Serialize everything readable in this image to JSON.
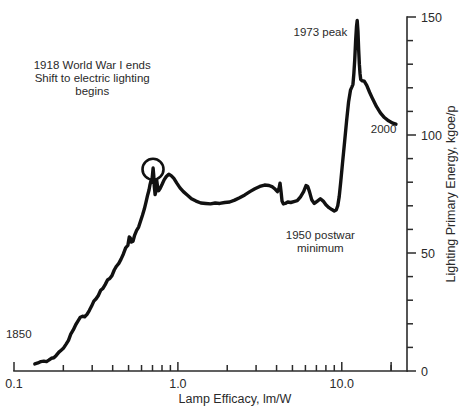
{
  "chart_data": {
    "type": "line",
    "title": "",
    "xlabel": "Lamp Efficacy, lm/W",
    "ylabel": "Lighting Primary Energy, kgoe/p",
    "xscale": "log",
    "xlim": [
      0.1,
      25
    ],
    "ylim": [
      0,
      150
    ],
    "x_tick_labels": [
      "0.1",
      "1.0",
      "10.0"
    ],
    "x_tick_values": [
      0.1,
      1.0,
      10.0
    ],
    "y_tick_labels": [
      "0",
      "50",
      "100",
      "150"
    ],
    "y_tick_values": [
      0,
      50,
      100,
      150
    ],
    "y_minor_step": 10,
    "grid": false,
    "legend": "none",
    "series_name": "UK lighting primary energy per capita vs lamp efficacy",
    "line_color": "#111111",
    "axis_color": "#2b2b2b",
    "points": [
      [
        0.134,
        3.0
      ],
      [
        0.14,
        3.4
      ],
      [
        0.146,
        4.0
      ],
      [
        0.152,
        4.2
      ],
      [
        0.158,
        4.0
      ],
      [
        0.163,
        4.6
      ],
      [
        0.169,
        5.4
      ],
      [
        0.175,
        5.6
      ],
      [
        0.181,
        6.6
      ],
      [
        0.188,
        8.0
      ],
      [
        0.194,
        8.8
      ],
      [
        0.2,
        9.6
      ],
      [
        0.208,
        11.4
      ],
      [
        0.215,
        13.0
      ],
      [
        0.222,
        15.6
      ],
      [
        0.23,
        17.4
      ],
      [
        0.238,
        19.6
      ],
      [
        0.246,
        21.2
      ],
      [
        0.254,
        22.8
      ],
      [
        0.262,
        23.2
      ],
      [
        0.27,
        23.0
      ],
      [
        0.279,
        24.0
      ],
      [
        0.288,
        25.6
      ],
      [
        0.297,
        27.4
      ],
      [
        0.307,
        29.6
      ],
      [
        0.317,
        30.6
      ],
      [
        0.327,
        32.0
      ],
      [
        0.338,
        34.2
      ],
      [
        0.349,
        35.0
      ],
      [
        0.36,
        36.6
      ],
      [
        0.372,
        38.6
      ],
      [
        0.384,
        39.2
      ],
      [
        0.396,
        40.4
      ],
      [
        0.409,
        42.8
      ],
      [
        0.422,
        44.4
      ],
      [
        0.436,
        45.6
      ],
      [
        0.45,
        47.4
      ],
      [
        0.465,
        49.6
      ],
      [
        0.48,
        52.2
      ],
      [
        0.495,
        53.2
      ],
      [
        0.505,
        56.8
      ],
      [
        0.512,
        56.4
      ],
      [
        0.52,
        54.6
      ],
      [
        0.532,
        55.0
      ],
      [
        0.545,
        57.6
      ],
      [
        0.56,
        59.6
      ],
      [
        0.576,
        61.0
      ],
      [
        0.592,
        63.6
      ],
      [
        0.608,
        66.0
      ],
      [
        0.624,
        68.6
      ],
      [
        0.64,
        71.8
      ],
      [
        0.654,
        74.6
      ],
      [
        0.666,
        76.6
      ],
      [
        0.676,
        79.0
      ],
      [
        0.684,
        80.4
      ],
      [
        0.692,
        80.0
      ],
      [
        0.7,
        83.2
      ],
      [
        0.706,
        86.0
      ],
      [
        0.712,
        83.0
      ],
      [
        0.718,
        78.2
      ],
      [
        0.726,
        74.8
      ],
      [
        0.734,
        76.0
      ],
      [
        0.742,
        81.0
      ],
      [
        0.752,
        78.0
      ],
      [
        0.764,
        76.4
      ],
      [
        0.78,
        77.4
      ],
      [
        0.8,
        79.0
      ],
      [
        0.824,
        81.0
      ],
      [
        0.85,
        82.4
      ],
      [
        0.88,
        83.4
      ],
      [
        0.91,
        82.8
      ],
      [
        0.945,
        81.6
      ],
      [
        0.985,
        79.6
      ],
      [
        1.03,
        77.6
      ],
      [
        1.08,
        76.0
      ],
      [
        1.14,
        74.6
      ],
      [
        1.21,
        73.0
      ],
      [
        1.29,
        72.0
      ],
      [
        1.38,
        71.2
      ],
      [
        1.48,
        71.0
      ],
      [
        1.58,
        70.8
      ],
      [
        1.69,
        71.2
      ],
      [
        1.8,
        71.0
      ],
      [
        1.93,
        71.4
      ],
      [
        2.07,
        71.6
      ],
      [
        2.22,
        72.4
      ],
      [
        2.38,
        73.4
      ],
      [
        2.56,
        74.6
      ],
      [
        2.75,
        76.0
      ],
      [
        2.95,
        77.2
      ],
      [
        3.16,
        78.2
      ],
      [
        3.38,
        78.8
      ],
      [
        3.6,
        78.6
      ],
      [
        3.78,
        78.0
      ],
      [
        3.93,
        77.0
      ],
      [
        4.05,
        76.0
      ],
      [
        4.14,
        77.4
      ],
      [
        4.2,
        79.6
      ],
      [
        4.26,
        76.0
      ],
      [
        4.32,
        72.0
      ],
      [
        4.4,
        70.8
      ],
      [
        4.52,
        71.0
      ],
      [
        4.68,
        71.6
      ],
      [
        4.88,
        71.4
      ],
      [
        5.1,
        71.8
      ],
      [
        5.35,
        72.2
      ],
      [
        5.6,
        73.8
      ],
      [
        5.85,
        76.0
      ],
      [
        6.05,
        78.6
      ],
      [
        6.2,
        78.2
      ],
      [
        6.35,
        76.0
      ],
      [
        6.55,
        72.6
      ],
      [
        6.8,
        71.0
      ],
      [
        7.1,
        72.0
      ],
      [
        7.4,
        73.0
      ],
      [
        7.7,
        72.0
      ],
      [
        8.0,
        70.4
      ],
      [
        8.35,
        69.2
      ],
      [
        8.7,
        68.4
      ],
      [
        9.0,
        67.8
      ],
      [
        9.25,
        68.2
      ],
      [
        9.45,
        70.0
      ],
      [
        9.65,
        74.0
      ],
      [
        9.85,
        80.0
      ],
      [
        10.1,
        88.0
      ],
      [
        10.4,
        97.0
      ],
      [
        10.7,
        106.0
      ],
      [
        11.0,
        114.0
      ],
      [
        11.3,
        119.0
      ],
      [
        11.55,
        120.5
      ],
      [
        11.7,
        121.5
      ],
      [
        11.85,
        126.0
      ],
      [
        12.0,
        132.0
      ],
      [
        12.15,
        140.0
      ],
      [
        12.3,
        146.0
      ],
      [
        12.42,
        148.5
      ],
      [
        12.55,
        144.0
      ],
      [
        12.68,
        136.0
      ],
      [
        12.8,
        130.0
      ],
      [
        12.92,
        126.0
      ],
      [
        13.05,
        123.5
      ],
      [
        13.3,
        123.0
      ],
      [
        13.7,
        122.8
      ],
      [
        14.2,
        121.0
      ],
      [
        14.8,
        118.0
      ],
      [
        15.5,
        115.0
      ],
      [
        16.3,
        112.0
      ],
      [
        17.2,
        109.4
      ],
      [
        18.2,
        107.4
      ],
      [
        19.3,
        106.0
      ],
      [
        20.5,
        105.0
      ],
      [
        21.4,
        104.6
      ]
    ],
    "annotations": [
      {
        "name": "start-year",
        "lines": [
          "1850"
        ],
        "x": 0.128,
        "y": 14.0,
        "anchor": "end"
      },
      {
        "name": "wwi-shift",
        "lines": [
          "1918 World War I ends",
          "Shift to electric lighting",
          "begins"
        ],
        "x": 0.3,
        "y": 128.0,
        "anchor": "middle"
      },
      {
        "name": "peak-1973",
        "lines": [
          "1973 peak"
        ],
        "x": 7.4,
        "y": 142.0,
        "anchor": "middle"
      },
      {
        "name": "postwar-minimum",
        "lines": [
          "1950 postwar",
          "minimum"
        ],
        "x": 7.4,
        "y": 56.0,
        "anchor": "middle"
      },
      {
        "name": "end-year",
        "lines": [
          "2000"
        ],
        "x": 18.0,
        "y": 101.0,
        "anchor": "middle"
      }
    ],
    "marker": {
      "name": "wwi-circle-marker",
      "x": 0.705,
      "y": 85.5,
      "radius": 10.5,
      "shape": "circle"
    }
  }
}
